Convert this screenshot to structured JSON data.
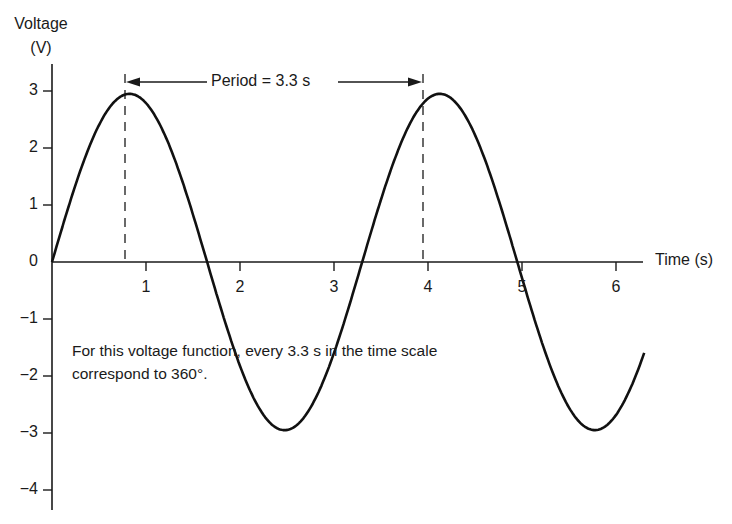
{
  "chart_data": {
    "type": "line",
    "title": "",
    "xlabel": "Time (s)",
    "ylabel": "Voltage (V)",
    "xlim": [
      0,
      6.3
    ],
    "ylim": [
      -4,
      3
    ],
    "xticks": [
      1,
      2,
      3,
      4,
      5,
      6
    ],
    "yticks": [
      3,
      2,
      1,
      0,
      -1,
      -2,
      -3,
      -4
    ],
    "grid": false,
    "series": [
      {
        "name": "v(t) = 2.95 sin(2π t / 3.3)",
        "function": "sine",
        "amplitude": 2.95,
        "period": 3.3,
        "x": [
          0,
          0.4,
          0.78,
          1.2,
          1.6,
          2.0,
          2.4,
          2.8,
          3.2,
          3.6,
          3.95,
          4.4,
          4.75,
          5.2,
          5.55,
          5.9,
          6.3
        ],
        "values": [
          0,
          2.06,
          2.95,
          2.03,
          -0.24,
          -2.0,
          -2.95,
          -1.88,
          0.44,
          2.25,
          2.95,
          1.44,
          -0.23,
          -2.49,
          -2.95,
          -1.77,
          0.52
        ]
      }
    ],
    "annotations": [
      {
        "type": "dimension-arrow",
        "text": "Period = 3.3 s",
        "from_x": 0.78,
        "to_x": 3.95
      },
      {
        "type": "dashed-vline",
        "x": 0.78
      },
      {
        "type": "dashed-vline",
        "x": 3.95
      },
      {
        "type": "text",
        "text": "For this voltage function, every 3.3 s in the time scale correspond to 360°."
      }
    ]
  },
  "labels": {
    "ylabel_line1": "Voltage",
    "ylabel_line2": "(V)",
    "xlabel": "Time (s)",
    "period": "Period = 3.3 s",
    "note_line1": "For this voltage function, every 3.3 s in the time scale",
    "note_line2": "correspond to 360°.",
    "yticks": [
      "3",
      "2",
      "1",
      "0",
      "−1",
      "−2",
      "−3",
      "−4"
    ],
    "xticks": [
      "1",
      "2",
      "3",
      "4",
      "5",
      "6"
    ]
  },
  "colors": {
    "ink": "#1a1a1a",
    "background": "#ffffff"
  }
}
